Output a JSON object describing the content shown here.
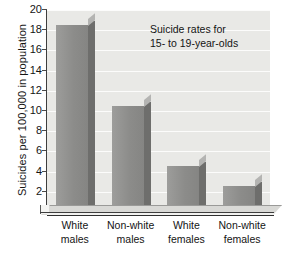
{
  "chart_data": {
    "type": "bar",
    "title_lines": [
      "Suicide rates for",
      "15- to 19-year-olds"
    ],
    "xlabel": "",
    "ylabel": "Suicides per 100,000 in population",
    "categories": [
      "White males",
      "Non-white males",
      "White females",
      "Non-white females"
    ],
    "category_lines": [
      [
        "White",
        "males"
      ],
      [
        "Non-white",
        "males"
      ],
      [
        "White",
        "females"
      ],
      [
        "Non-white",
        "females"
      ]
    ],
    "values": [
      18.5,
      10.5,
      4.6,
      2.6
    ],
    "ylim": [
      0,
      20
    ],
    "ytick_values": [
      2,
      4,
      6,
      8,
      10,
      12,
      14,
      16,
      18,
      20
    ],
    "ytick_labels": [
      "2",
      "4",
      "6",
      "8",
      "10",
      "12",
      "14",
      "16",
      "18",
      "20"
    ],
    "grid": true,
    "grid_orientation": "horizontal",
    "legend": false,
    "legend_position": "none",
    "style": "3d-bar",
    "colors": {
      "bar_face": "#8c8c8a",
      "bar_side": "#6e6e6c",
      "bar_top": "#b4b4b2",
      "plot_background": "#e9e9e6",
      "gridline": "#fcfcfb",
      "axis": "#3e3e3e",
      "text": "#141414",
      "page_background": "#ffffff"
    }
  }
}
